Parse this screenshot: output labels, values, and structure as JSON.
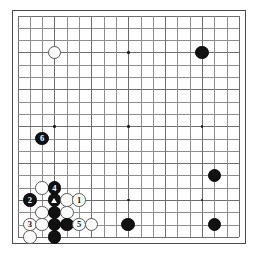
{
  "diagram": {
    "kind": "go-board-diagram",
    "board_size": 19,
    "colors": {
      "page_background": "#ffffff",
      "board_background": "#ffffff",
      "grid_line": "#8e8e8e",
      "grid_line_major": "#6d6d6d",
      "border": "#4a4a4a",
      "black_stone": "#111111",
      "white_stone": "#fbfbfb",
      "white_stone_edge": "#595959",
      "star_point": "#1b1b1b",
      "black_label_text": "#ffffff",
      "white_label_text": "#111111"
    },
    "geometry": {
      "board_left": 18,
      "board_top": 16,
      "cell": 12.3,
      "stone_diameter": 13.6,
      "star_diameter": 2.6,
      "border_width": 1.4
    },
    "star_points": [
      {
        "col": 4,
        "row": 4
      },
      {
        "col": 10,
        "row": 4
      },
      {
        "col": 16,
        "row": 4
      },
      {
        "col": 4,
        "row": 10
      },
      {
        "col": 10,
        "row": 10
      },
      {
        "col": 16,
        "row": 10
      },
      {
        "col": 4,
        "row": 16
      },
      {
        "col": 10,
        "row": 16
      },
      {
        "col": 16,
        "row": 16
      }
    ],
    "stones": [
      {
        "col": 4,
        "row": 4,
        "color": "white",
        "label": "",
        "mark": ""
      },
      {
        "col": 16,
        "row": 4,
        "color": "black",
        "label": "",
        "mark": ""
      },
      {
        "col": 3,
        "row": 11,
        "color": "black",
        "label": "6",
        "mark": ""
      },
      {
        "col": 3,
        "row": 15,
        "color": "white",
        "label": "",
        "mark": ""
      },
      {
        "col": 4,
        "row": 15,
        "color": "black",
        "label": "4",
        "mark": ""
      },
      {
        "col": 2,
        "row": 16,
        "color": "black",
        "label": "2",
        "mark": ""
      },
      {
        "col": 4,
        "row": 16,
        "color": "black",
        "label": "",
        "mark": "triangle"
      },
      {
        "col": 5,
        "row": 16,
        "color": "white",
        "label": "",
        "mark": ""
      },
      {
        "col": 6,
        "row": 16,
        "color": "white",
        "label": "1",
        "mark": ""
      },
      {
        "col": 3,
        "row": 17,
        "color": "white",
        "label": "",
        "mark": ""
      },
      {
        "col": 4,
        "row": 17,
        "color": "black",
        "label": "",
        "mark": ""
      },
      {
        "col": 5,
        "row": 17,
        "color": "white",
        "label": "",
        "mark": ""
      },
      {
        "col": 2,
        "row": 18,
        "color": "white",
        "label": "3",
        "mark": ""
      },
      {
        "col": 3,
        "row": 18,
        "color": "white",
        "label": "",
        "mark": ""
      },
      {
        "col": 4,
        "row": 18,
        "color": "black",
        "label": "",
        "mark": ""
      },
      {
        "col": 5,
        "row": 18,
        "color": "black",
        "label": "",
        "mark": ""
      },
      {
        "col": 6,
        "row": 18,
        "color": "white",
        "label": "5",
        "mark": ""
      },
      {
        "col": 7,
        "row": 18,
        "color": "white",
        "label": "",
        "mark": ""
      },
      {
        "col": 10,
        "row": 18,
        "color": "black",
        "label": "",
        "mark": ""
      },
      {
        "col": 17,
        "row": 14,
        "color": "black",
        "label": "",
        "mark": ""
      },
      {
        "col": 17,
        "row": 18,
        "color": "black",
        "label": "",
        "mark": ""
      },
      {
        "col": 2,
        "row": 19,
        "color": "white",
        "label": "",
        "mark": ""
      },
      {
        "col": 4,
        "row": 19,
        "color": "black",
        "label": "",
        "mark": ""
      }
    ],
    "smudges": [
      {
        "x": 176,
        "y": 196,
        "w": 62,
        "h": 34
      },
      {
        "x": 150,
        "y": 214,
        "w": 44,
        "h": 22
      },
      {
        "x": 196,
        "y": 186,
        "w": 30,
        "h": 18
      }
    ]
  }
}
